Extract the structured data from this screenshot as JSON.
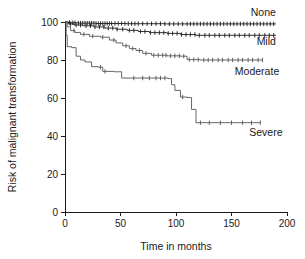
{
  "chart_data": {
    "type": "line",
    "subtype": "kaplan-meier-survival",
    "title": "",
    "xlabel": "Time in months",
    "ylabel": "Risk of malignant transformation",
    "xlim": [
      0,
      200
    ],
    "ylim": [
      0,
      100
    ],
    "xticks": [
      0,
      50,
      100,
      150,
      200
    ],
    "yticks": [
      0,
      20,
      40,
      60,
      80,
      100
    ],
    "grid": false,
    "legend_position": "inline-right-of-curve",
    "series": [
      {
        "name": "None",
        "label": "None",
        "color": "#1a1a1a",
        "label_x": 190,
        "label_y": 103,
        "final_value": 99,
        "steps": [
          [
            0,
            100
          ],
          [
            2,
            99.8
          ],
          [
            6,
            99.6
          ],
          [
            12,
            99.4
          ],
          [
            28,
            99.2
          ],
          [
            55,
            99.1
          ],
          [
            90,
            99.0
          ],
          [
            190,
            99.0
          ]
        ],
        "censor_times": [
          4,
          7,
          9,
          12,
          14,
          16,
          18,
          20,
          22,
          24,
          26,
          28,
          30,
          32,
          34,
          36,
          38,
          40,
          42,
          45,
          48,
          51,
          54,
          57,
          60,
          63,
          66,
          70,
          74,
          78,
          82,
          86,
          90,
          94,
          98,
          102,
          106,
          110,
          113,
          116,
          119,
          122,
          125,
          128,
          131,
          134,
          137,
          140,
          143,
          146,
          149,
          152,
          155,
          158,
          161,
          164,
          167,
          170,
          173,
          176,
          179,
          182,
          185,
          188
        ]
      },
      {
        "name": "Mild",
        "label": "Mild",
        "color": "#1a1a1a",
        "label_x": 190,
        "label_y": 88,
        "final_value": 93,
        "steps": [
          [
            0,
            100
          ],
          [
            3,
            99
          ],
          [
            8,
            98.4
          ],
          [
            16,
            98
          ],
          [
            26,
            97.4
          ],
          [
            36,
            96.8
          ],
          [
            46,
            96.2
          ],
          [
            56,
            95.6
          ],
          [
            66,
            95.0
          ],
          [
            76,
            94.4
          ],
          [
            92,
            94.0
          ],
          [
            104,
            93.4
          ],
          [
            118,
            93.0
          ],
          [
            190,
            93.0
          ]
        ],
        "censor_times": [
          5,
          10,
          14,
          19,
          23,
          27,
          31,
          35,
          39,
          43,
          47,
          52,
          58,
          62,
          68,
          72,
          77,
          81,
          85,
          89,
          93,
          97,
          101,
          105,
          109,
          113,
          117,
          121,
          126,
          130,
          135,
          139,
          144,
          148,
          153,
          157,
          162,
          166,
          171,
          175,
          180,
          184,
          188
        ]
      },
      {
        "name": "Moderate",
        "label": "Moderate",
        "color": "#555555",
        "label_x": 193,
        "label_y": 72,
        "final_value": 80,
        "steps": [
          [
            0,
            100
          ],
          [
            2,
            97.5
          ],
          [
            5,
            95.5
          ],
          [
            9,
            94.5
          ],
          [
            14,
            93.5
          ],
          [
            22,
            92.5
          ],
          [
            32,
            92.0
          ],
          [
            40,
            90.5
          ],
          [
            46,
            89.0
          ],
          [
            52,
            87.5
          ],
          [
            58,
            86.0
          ],
          [
            64,
            85.0
          ],
          [
            70,
            83.5
          ],
          [
            78,
            82.5
          ],
          [
            92,
            82.2
          ],
          [
            104,
            82.0
          ],
          [
            110,
            80.2
          ],
          [
            122,
            80.0
          ],
          [
            178,
            80.0
          ]
        ],
        "censor_times": [
          8,
          17,
          25,
          34,
          44,
          55,
          61,
          67,
          73,
          80,
          84,
          88,
          91,
          95,
          99,
          103,
          107,
          112,
          116,
          120,
          125,
          129,
          133,
          138,
          142,
          147,
          151,
          156,
          160,
          165,
          169,
          174,
          178
        ]
      },
      {
        "name": "Severe",
        "label": "Severe",
        "color": "#555555",
        "label_x": 196,
        "label_y": 40,
        "final_value": 47,
        "steps": [
          [
            0,
            100
          ],
          [
            1,
            93
          ],
          [
            2,
            87
          ],
          [
            6,
            86.5
          ],
          [
            10,
            82
          ],
          [
            14,
            80
          ],
          [
            18,
            79
          ],
          [
            24,
            76.5
          ],
          [
            30,
            76.2
          ],
          [
            34,
            74
          ],
          [
            44,
            73.8
          ],
          [
            51,
            70.5
          ],
          [
            93,
            70.2
          ],
          [
            96,
            67
          ],
          [
            99,
            64
          ],
          [
            104,
            60.5
          ],
          [
            110,
            60.2
          ],
          [
            114,
            54
          ],
          [
            118,
            47
          ],
          [
            176,
            47
          ]
        ],
        "censor_times": [
          32,
          36,
          62,
          70,
          76,
          82,
          86,
          90,
          106,
          122,
          130,
          140,
          150,
          160,
          168,
          176
        ]
      }
    ]
  },
  "axes": {
    "x_tick_labels": [
      "0",
      "50",
      "100",
      "150",
      "200"
    ],
    "y_tick_labels": [
      "0",
      "20",
      "40",
      "60",
      "80",
      "100"
    ],
    "x_title": "Time in months",
    "y_title": "Risk of malignant transformation"
  },
  "colors": {
    "axis": "#1a1a1a",
    "background": "#ffffff",
    "curve_dark": "#1a1a1a",
    "curve_gray": "#555555"
  }
}
